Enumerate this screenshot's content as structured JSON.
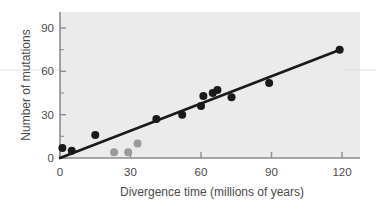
{
  "chart_data": {
    "type": "scatter",
    "title": "",
    "xlabel": "Divergence time (millions of years)",
    "ylabel": "Number of mutations",
    "xlim": [
      0,
      126
    ],
    "ylim": [
      0,
      96
    ],
    "xticks": [
      0,
      30,
      60,
      90,
      120
    ],
    "yticks": [
      0,
      30,
      60,
      90
    ],
    "xtick_labels": [
      "0",
      "30",
      "60",
      "90",
      "120"
    ],
    "ytick_labels": [
      "0",
      "30",
      "60",
      "90"
    ],
    "grid": false,
    "legend": "none",
    "plot_background": "#ebebeb",
    "series": [
      {
        "name": "primary-data",
        "color": "#1a1a1a",
        "marker": "filled-circle",
        "points": [
          {
            "x": 1,
            "y": 7
          },
          {
            "x": 5,
            "y": 5
          },
          {
            "x": 15,
            "y": 16
          },
          {
            "x": 41,
            "y": 27
          },
          {
            "x": 52,
            "y": 30
          },
          {
            "x": 60,
            "y": 36
          },
          {
            "x": 61,
            "y": 43
          },
          {
            "x": 65,
            "y": 45
          },
          {
            "x": 67,
            "y": 47
          },
          {
            "x": 73,
            "y": 42
          },
          {
            "x": 89,
            "y": 52
          },
          {
            "x": 119,
            "y": 75
          }
        ]
      },
      {
        "name": "secondary-data",
        "color": "#9a9a9a",
        "marker": "filled-circle",
        "points": [
          {
            "x": 23,
            "y": 4
          },
          {
            "x": 29,
            "y": 4
          },
          {
            "x": 33,
            "y": 10
          }
        ]
      }
    ],
    "trendline": {
      "name": "regression-line",
      "color": "#1a1a1a",
      "x_start": 0,
      "y_start": 0,
      "x_end": 120,
      "y_end": 75.5
    }
  },
  "ghost_text": {
    "line_1": "correlation between",
    "line_2": "the relationship of",
    "line_3": "of divergence time",
    "line_4": "mutations in the",
    "line_5": "molecular clock"
  }
}
